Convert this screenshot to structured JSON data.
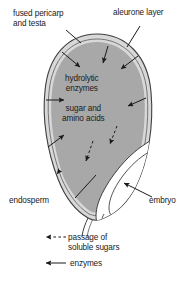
{
  "diagram": {
    "type": "biology-cross-section",
    "colors": {
      "seed_coat": "#d9d9d9",
      "endosperm": "#a6a6a6",
      "embryo": "#ffffff",
      "outline": "#3a3a3a",
      "text": "#1a1a1a",
      "background": "#ffffff"
    },
    "labels": {
      "fused_pericarp": "fused pericarp\nand testa",
      "aleurone_layer": "aleurone layer",
      "hydrolytic_enzymes": "hydrolytic\nenzymes",
      "sugar_amino_acids": "sugar and\namino acids",
      "endosperm": "endosperm",
      "embryo": "embryo"
    },
    "legend": {
      "items": [
        {
          "key": "dashed-arrow",
          "label": "passage of\nsoluble sugars",
          "style": "dashed"
        },
        {
          "key": "solid-arrow",
          "label": "enzymes",
          "style": "solid"
        }
      ]
    },
    "annotations": {
      "enzyme_arrows_count": 6,
      "sugar_arrows_count": 3,
      "enzyme_arrow_description": "solid arrows pointing inward from aleurone layer into endosperm",
      "sugar_arrow_description": "dashed arrows pointing from endosperm toward embryo"
    }
  }
}
